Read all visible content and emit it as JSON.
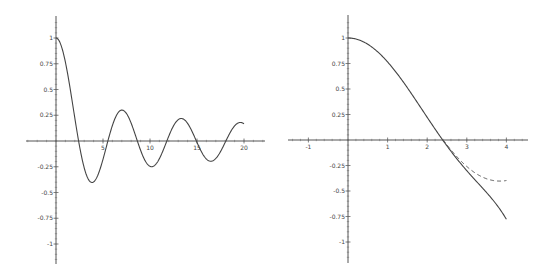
{
  "chart_data": [
    {
      "type": "line",
      "title": "",
      "xlabel": "",
      "ylabel": "",
      "xlim": [
        -3.2,
        22.2
      ],
      "ylim": [
        -1.18,
        1.25
      ],
      "grid": false,
      "legend": null,
      "x_ticks": [
        5,
        10,
        15,
        20
      ],
      "x_tick_labels": [
        "5",
        "10",
        "15",
        "20"
      ],
      "y_ticks": [
        1,
        0.75,
        0.5,
        0.25,
        -0.25,
        -0.5,
        -0.75,
        -1
      ],
      "y_tick_labels": [
        "1",
        "0.75",
        "0.5",
        "0.25",
        "-0.25",
        "-0.5",
        "-0.75",
        "-1"
      ],
      "series": [
        {
          "name": "J0(x)",
          "style": "solid",
          "x": [
            0,
            1,
            2,
            2.405,
            3,
            3.832,
            4,
            5,
            5.52,
            6,
            7,
            7.016,
            8,
            8.654,
            9,
            10,
            10.17,
            11,
            11.79,
            12,
            13,
            13.32,
            14,
            14.93,
            15,
            16,
            16.47,
            17,
            18,
            18.07,
            19,
            19.62,
            20
          ],
          "y": [
            1,
            0.7652,
            0.2239,
            0,
            -0.2601,
            -0.4028,
            -0.3971,
            -0.1776,
            0,
            0.1506,
            0.3001,
            0.3001,
            0.1717,
            0,
            -0.0903,
            -0.2459,
            -0.2497,
            -0.1712,
            0,
            0.0477,
            0.2069,
            0.2184,
            0.1711,
            0,
            -0.0142,
            -0.1749,
            -0.201,
            -0.1699,
            -0.0134,
            0,
            0.1466,
            0.1787,
            0.167
          ]
        }
      ]
    },
    {
      "type": "line",
      "title": "",
      "xlabel": "",
      "ylabel": "",
      "xlim": [
        -1.5,
        4.55
      ],
      "ylim": [
        -1.2,
        1.23
      ],
      "grid": false,
      "legend": null,
      "x_ticks": [
        -1,
        1,
        2,
        3,
        4
      ],
      "x_tick_labels": [
        "-1",
        "1",
        "2",
        "3",
        "4"
      ],
      "y_ticks": [
        1,
        0.75,
        0.5,
        0.25,
        -0.25,
        -0.5,
        -0.75,
        -1
      ],
      "y_tick_labels": [
        "1",
        "0.75",
        "0.5",
        "0.25",
        "-0.25",
        "-0.5",
        "-0.75",
        "-1"
      ],
      "series": [
        {
          "name": "Taylor polynomial (degree 6) of J0",
          "style": "solid",
          "x": [
            0,
            0.5,
            1,
            1.5,
            2,
            2.5,
            3,
            3.5,
            4
          ],
          "y": [
            1,
            0.9385,
            0.7652,
            0.5114,
            0.2222,
            -0.0623,
            -0.3164,
            -0.5404,
            -0.7778
          ]
        },
        {
          "name": "J0(x)",
          "style": "dashed",
          "x": [
            2.4,
            2.6,
            2.8,
            3,
            3.2,
            3.4,
            3.6,
            3.8,
            4
          ],
          "y": [
            0.0025,
            -0.0968,
            -0.185,
            -0.2601,
            -0.3202,
            -0.3643,
            -0.3918,
            -0.4026,
            -0.3971
          ]
        }
      ]
    }
  ]
}
